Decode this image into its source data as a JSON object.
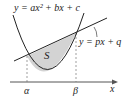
{
  "diagram": {
    "parabola_label": "y = ax² + bx + c",
    "line_label": "y = px + q",
    "region_label": "S",
    "x_axis_label": "x",
    "alpha_label": "α",
    "beta_label": "β",
    "colors": {
      "stroke": "#222222",
      "region_fill": "#d3d3d3",
      "guide": "#777777"
    }
  }
}
